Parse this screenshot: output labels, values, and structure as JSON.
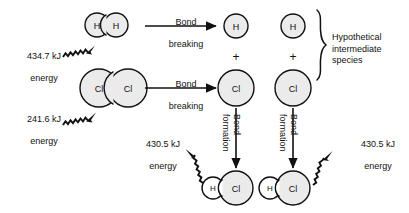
{
  "diagram": {
    "colors": {
      "stroke": "#111111",
      "atom_fill_large": "#ebebeb",
      "atom_fill_small": "#ffffff",
      "background": "#ffffff",
      "text": "#111111"
    },
    "reactants": {
      "h2": {
        "left_atom_label": "H",
        "right_atom_label": "H"
      },
      "cl2": {
        "left_atom_label": "Cl",
        "right_atom_label": "Cl"
      }
    },
    "energy_inputs": [
      {
        "id": "h2-bond-energy",
        "value": "434.7 kJ",
        "unit_line": "energy",
        "direction": "absorbed"
      },
      {
        "id": "cl2-bond-energy",
        "value": "241.6 kJ",
        "unit_line": "energy",
        "direction": "absorbed"
      }
    ],
    "energy_outputs": [
      {
        "id": "hcl-left-bond-energy",
        "value": "430.5 kJ",
        "unit_line": "energy",
        "direction": "released"
      },
      {
        "id": "hcl-right-bond-energy",
        "value": "430.5 kJ",
        "unit_line": "energy",
        "direction": "released"
      }
    ],
    "process_arrows": [
      {
        "id": "bond-breaking-h2",
        "line1": "Bond",
        "line2": "breaking",
        "orientation": "horizontal"
      },
      {
        "id": "bond-breaking-cl2",
        "line1": "Bond",
        "line2": "breaking",
        "orientation": "horizontal"
      },
      {
        "id": "bond-formation-left",
        "line1": "Bond",
        "line2": "formation",
        "orientation": "vertical"
      },
      {
        "id": "bond-formation-right",
        "line1": "Bond",
        "line2": "formation",
        "orientation": "vertical"
      }
    ],
    "intermediates": {
      "h_atom_left_label": "H",
      "h_atom_right_label": "H",
      "cl_atom_left_label": "Cl",
      "cl_atom_right_label": "Cl",
      "plus_left": "+",
      "plus_right": "+",
      "brace_caption_line1": "Hypothetical",
      "brace_caption_line2": "intermediate",
      "brace_caption_line3": "species"
    },
    "products": {
      "hcl_left": {
        "h_label": "H",
        "cl_label": "Cl"
      },
      "hcl_right": {
        "h_label": "H",
        "cl_label": "Cl"
      }
    }
  }
}
